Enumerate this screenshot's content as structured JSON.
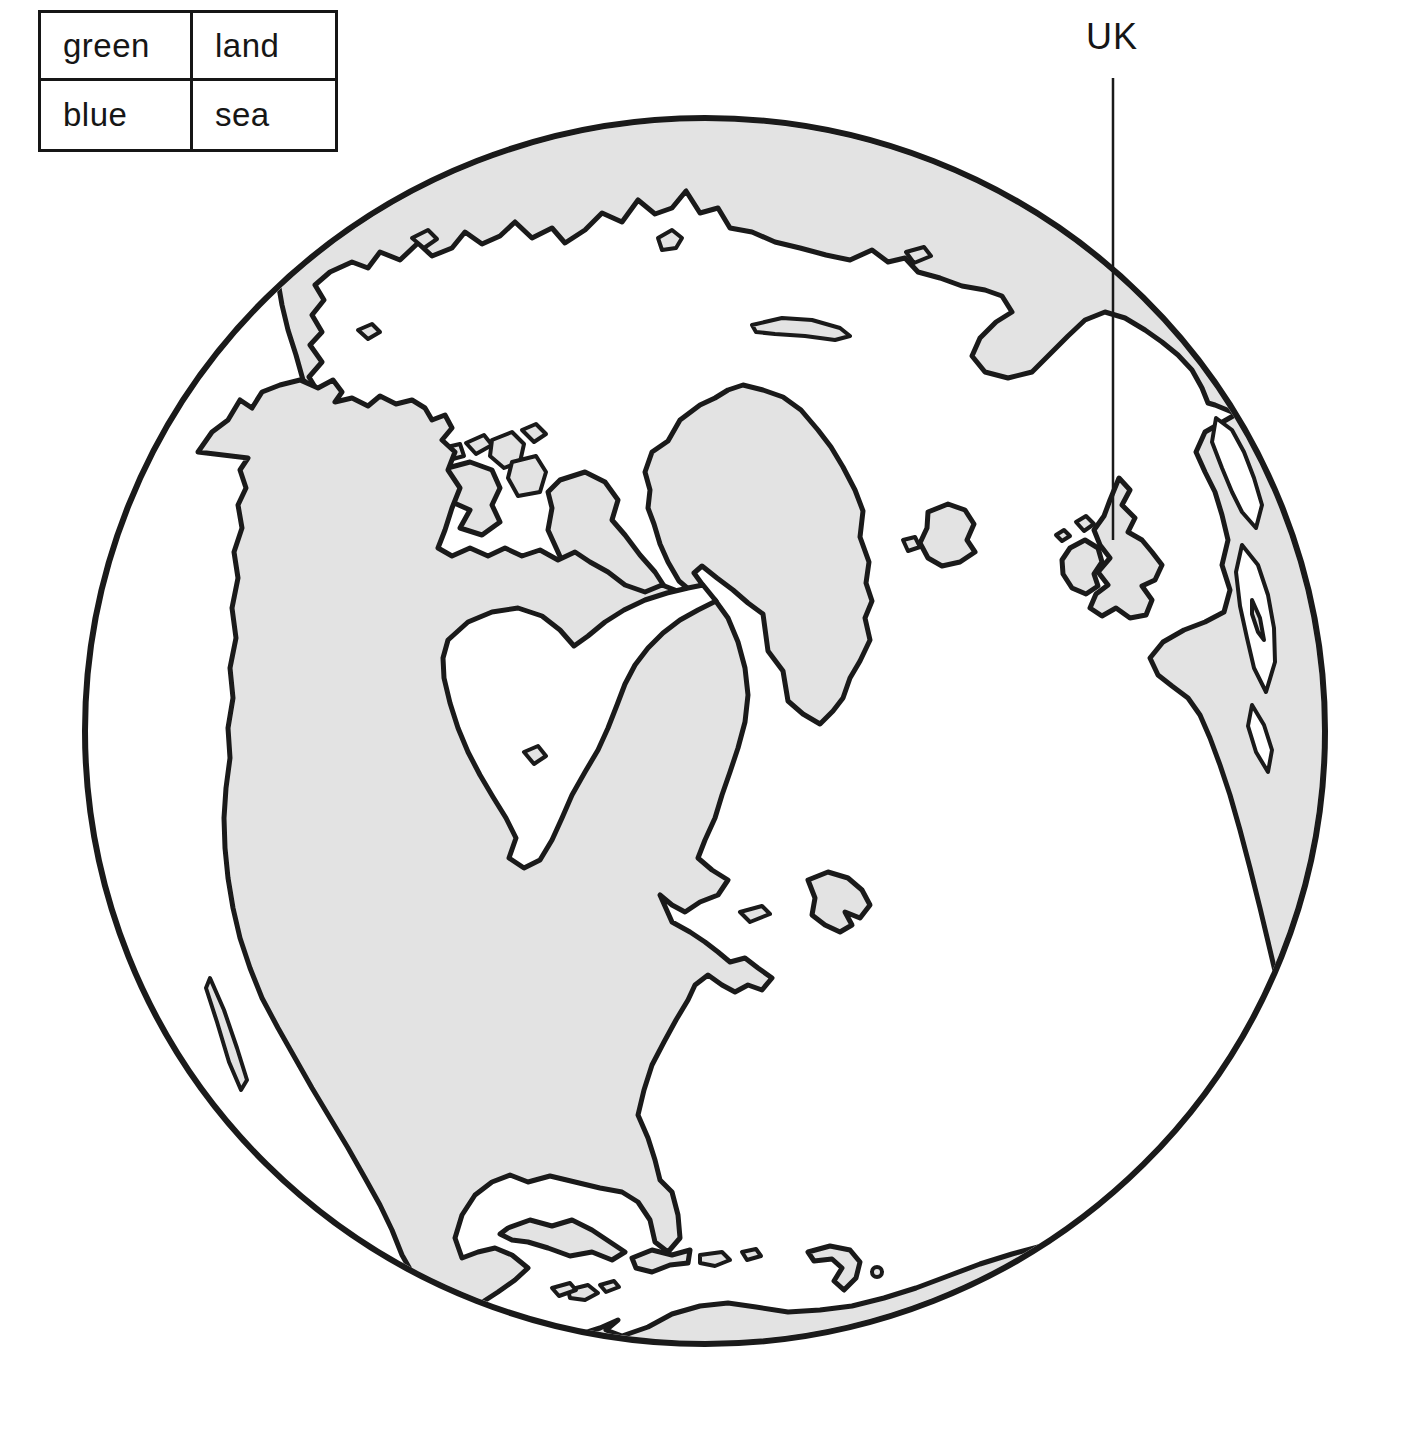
{
  "legend": {
    "rows": [
      {
        "color": "green",
        "feature": "land"
      },
      {
        "color": "blue",
        "feature": "sea"
      }
    ]
  },
  "map": {
    "uk_label": "UK",
    "colors": {
      "land": "#e3e3e3",
      "sea": "#ffffff",
      "outline": "#1a1a1a"
    }
  }
}
